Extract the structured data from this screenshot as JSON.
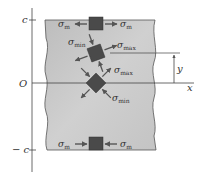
{
  "diagram": {
    "colors": {
      "beam_fill": "#c9c9c9",
      "element_fill": "#4a4a4a",
      "arrow": "#555555",
      "axis": "#444444",
      "text": "#333333"
    },
    "axis_labels": {
      "top": "c",
      "origin": "O",
      "bottom": "− c",
      "x": "x",
      "y": "y"
    },
    "stress_symbol": "σ",
    "elements": [
      {
        "id": "top",
        "left_label_sub": "m",
        "right_label_sub": "m",
        "state": "tension"
      },
      {
        "id": "upper-middle",
        "label_min_sub": "min",
        "label_max_sub": "max",
        "rotation_deg": 22
      },
      {
        "id": "neutral-axis",
        "label_max_sub": "max",
        "label_min_sub": "min",
        "rotation_deg": 45
      },
      {
        "id": "bottom",
        "left_label_sub": "m",
        "right_label_sub": "m",
        "state": "compression"
      }
    ]
  }
}
